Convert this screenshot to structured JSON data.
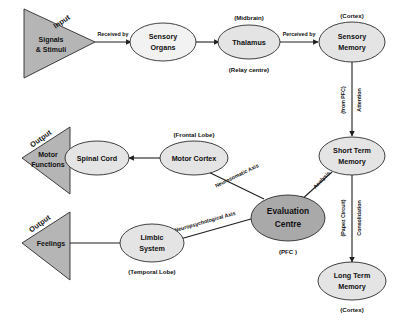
{
  "diagram": {
    "colors": {
      "background": "#ffffff",
      "node_fill_light": "#e4e4e4",
      "node_fill_pale": "#f2f2f2",
      "node_fill_dark": "#a9a9a9",
      "triangle_fill": "#b5b5b5",
      "stroke": "#1f1f1f",
      "text": "#111111"
    },
    "triangles": [
      {
        "id": "input",
        "rotated_label": "Input",
        "line1": "Signals",
        "line2": "& Stimuli"
      },
      {
        "id": "output-motor",
        "rotated_label": "Output",
        "line1": "Motor",
        "line2": "Functions"
      },
      {
        "id": "output-feelings",
        "rotated_label": "Output",
        "line1": "Feelings",
        "line2": ""
      }
    ],
    "nodes": [
      {
        "id": "sensory-organs",
        "line1": "Sensory",
        "line2": "Organs",
        "caption_top": "",
        "caption_bottom": ""
      },
      {
        "id": "thalamus",
        "line1": "Thalamus",
        "line2": "",
        "caption_top": "(Midbrain)",
        "caption_bottom": "(Relay centre)"
      },
      {
        "id": "sensory-memory",
        "line1": "Sensory",
        "line2": "Memory",
        "caption_top": "(Cortex)",
        "caption_bottom": ""
      },
      {
        "id": "short-term-memory",
        "line1": "Short Term",
        "line2": "Memory",
        "caption_top": "",
        "caption_bottom": ""
      },
      {
        "id": "long-term-memory",
        "line1": "Long Term",
        "line2": "Memory",
        "caption_top": "",
        "caption_bottom": "(Cortex)"
      },
      {
        "id": "evaluation-centre",
        "line1": "Evaluation",
        "line2": "Centre",
        "caption_top": "",
        "caption_bottom": "(PFC )"
      },
      {
        "id": "motor-cortex",
        "line1": "Motor Cortex",
        "line2": "",
        "caption_top": "(Frontal Lobe)",
        "caption_bottom": ""
      },
      {
        "id": "spinal-cord",
        "line1": "Spinal Cord",
        "line2": "",
        "caption_top": "",
        "caption_bottom": ""
      },
      {
        "id": "limbic-system",
        "line1": "Limbic",
        "line2": "System",
        "caption_top": "",
        "caption_bottom": "(Temporal Lobe)"
      }
    ],
    "edge_labels": {
      "received_by": "Received by",
      "perceived_by": "Perceived by",
      "attention": "Attention",
      "from_pfc": "(from PFC)",
      "consolidation": "Consolidation",
      "papez_circuit": "(Papez Circuit)",
      "analysis": "Analysis",
      "neurosomatic_axis": "Neurosomatic Axis",
      "neuropsychological_axis": "Neuropsychological Axis"
    }
  }
}
